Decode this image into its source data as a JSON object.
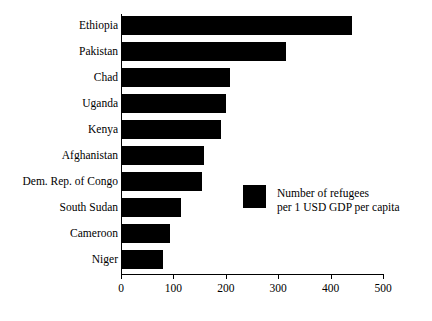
{
  "chart_data": {
    "type": "bar",
    "orientation": "horizontal",
    "title": "",
    "xlabel": "",
    "ylabel": "",
    "xlim": [
      0,
      500
    ],
    "ylim": null,
    "grid": false,
    "legend_position": "center-right",
    "bar_color": "#000000",
    "categories": [
      "Ethiopia",
      "Pakistan",
      "Chad",
      "Uganda",
      "Kenya",
      "Afghanistan",
      "Dem. Rep. of Congo",
      "South Sudan",
      "Cameroon",
      "Niger"
    ],
    "values": [
      440,
      315,
      208,
      200,
      190,
      158,
      154,
      115,
      94,
      81
    ],
    "xticks": [
      0,
      100,
      200,
      300,
      400,
      500
    ],
    "xtick_labels": [
      "0",
      "100",
      "200",
      "300",
      "400",
      "500"
    ],
    "legend": [
      {
        "label_line1": "Number of refugees",
        "label_line2": "per 1 USD GDP per capita",
        "color": "#000000"
      }
    ]
  }
}
